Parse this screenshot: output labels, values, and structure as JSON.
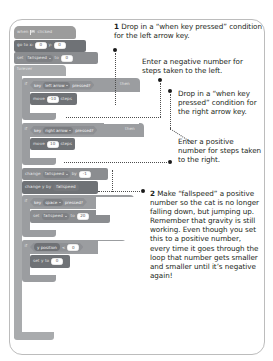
{
  "page": {
    "background": "#ffffff",
    "card_border_color": "#bcbcbc"
  },
  "script": {
    "title": "scratch-script",
    "blocks": [
      {
        "id": "when-flag-clicked",
        "type": "event",
        "text_before": "when",
        "icon": "green-flag-icon",
        "text_after": "clicked"
      },
      {
        "id": "go-to-xy",
        "type": "motion",
        "label_x": "go to x:",
        "value_x": "0",
        "label_y": "y:",
        "value_y": "0"
      },
      {
        "id": "set-fallspeed-0",
        "type": "data",
        "label_set": "set",
        "variable": "fallspeed",
        "label_to": "to",
        "value": "0"
      },
      {
        "id": "forever",
        "type": "control",
        "label": "forever"
      },
      {
        "id": "if-left-arrow",
        "type": "control",
        "label_if": "if",
        "cond_key": "key",
        "cond_value": "left arrow",
        "cond_pressed": "pressed?",
        "label_then": "then"
      },
      {
        "id": "move-negative-10",
        "type": "motion",
        "label_move": "move",
        "value": "-10",
        "label_steps": "steps"
      },
      {
        "id": "if-right-arrow",
        "type": "control",
        "label_if": "if",
        "cond_key": "key",
        "cond_value": "right arrow",
        "cond_pressed": "pressed?",
        "label_then": "then"
      },
      {
        "id": "move-10",
        "type": "motion",
        "label_move": "move",
        "value": "10",
        "label_steps": "steps"
      },
      {
        "id": "change-fallspeed",
        "type": "data",
        "label_change": "change",
        "variable": "fallspeed",
        "label_by": "by",
        "value": "-1"
      },
      {
        "id": "change-y-by",
        "type": "motion",
        "label_change": "change y by",
        "variable": "fallspeed"
      },
      {
        "id": "if-space",
        "type": "control",
        "label_if": "if",
        "cond_key": "key",
        "cond_value": "space",
        "cond_pressed": "pressed?",
        "label_then": "then"
      },
      {
        "id": "set-fallspeed-20",
        "type": "data",
        "label_set": "set",
        "variable": "fallspeed",
        "label_to": "to",
        "value": "20"
      },
      {
        "id": "if-y-position",
        "type": "control",
        "label_if": "if",
        "reporter": "y position",
        "operator": "<",
        "value": "0",
        "label_then": "then"
      },
      {
        "id": "set-y-to-0",
        "type": "motion",
        "label_set": "set y to",
        "value": "0"
      }
    ]
  },
  "annotations": {
    "note1": {
      "number": "1",
      "text": "Drop in a “when key pressed” condition for the left arrow key."
    },
    "note_negative": {
      "text": "Enter a negative number for steps taken to the left."
    },
    "note_right_arrow": {
      "text": "Drop in a “when key pressed” condition for the right arrow key."
    },
    "note_positive": {
      "text": "Enter a positive number for steps taken to the right."
    },
    "note2": {
      "number": "2",
      "text": "Make “fallspeed” a positive number so the cat is no longer falling down, but jumping up. Remember that gravity is still working. Even though you set this to a positive number, every time it goes through the loop that number gets smaller and smaller until it’s negative again!"
    }
  }
}
